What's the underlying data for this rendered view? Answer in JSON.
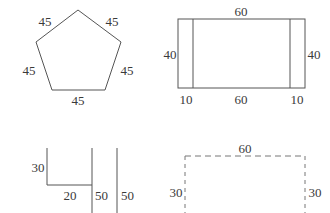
{
  "figures": {
    "pentagon": {
      "name": "regular-pentagon",
      "labels": {
        "top_left": "45",
        "top_right": "45",
        "left": "45",
        "right": "45",
        "bottom": "45"
      }
    },
    "rectangle": {
      "name": "rectangle-with-side-strips",
      "labels": {
        "top": "60",
        "left": "40",
        "right": "40",
        "bottom_left": "10",
        "bottom_middle": "60",
        "bottom_right": "10"
      }
    },
    "ushape": {
      "name": "open-u-shape-with-extra-vertical",
      "labels": {
        "left_height": "30",
        "base": "20",
        "middle_vertical": "50",
        "right_vertical": "50"
      }
    },
    "dashed": {
      "name": "dashed-open-rectangle",
      "labels": {
        "top": "60",
        "left": "30",
        "right": "30"
      }
    }
  },
  "style": {
    "stroke_color": "#555555",
    "dashed_stroke_color": "#777777",
    "background": "#ffffff",
    "text_color": "#3a3a3a"
  }
}
